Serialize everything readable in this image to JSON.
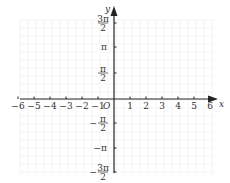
{
  "diagram": {
    "type": "cartesian-axes",
    "origin_label": "O",
    "x_axis": {
      "label": "x",
      "ticks": [
        {
          "value": -6,
          "label": "−6"
        },
        {
          "value": -5,
          "label": "−5"
        },
        {
          "value": -4,
          "label": "−4"
        },
        {
          "value": -3,
          "label": "−3"
        },
        {
          "value": -2,
          "label": "−2"
        },
        {
          "value": -1,
          "label": "−1"
        },
        {
          "value": 1,
          "label": "1"
        },
        {
          "value": 2,
          "label": "2"
        },
        {
          "value": 3,
          "label": "3"
        },
        {
          "value": 4,
          "label": "4"
        },
        {
          "value": 5,
          "label": "5"
        },
        {
          "value": 6,
          "label": "6"
        }
      ]
    },
    "y_axis": {
      "label": "y",
      "ticks": [
        {
          "value": "3π/2",
          "num": "3π",
          "den": "2",
          "sign": ""
        },
        {
          "value": "π",
          "num": "π",
          "den": "",
          "sign": ""
        },
        {
          "value": "π/2",
          "num": "π",
          "den": "2",
          "sign": ""
        },
        {
          "value": "-π/2",
          "num": "π",
          "den": "2",
          "sign": "−"
        },
        {
          "value": "-π",
          "num": "π",
          "den": "",
          "sign": "−"
        },
        {
          "value": "-3π/2",
          "num": "3π",
          "den": "2",
          "sign": "−"
        }
      ]
    },
    "colors": {
      "axis": "#222222",
      "text": "#333333",
      "grid": "#f4f4f4"
    }
  }
}
